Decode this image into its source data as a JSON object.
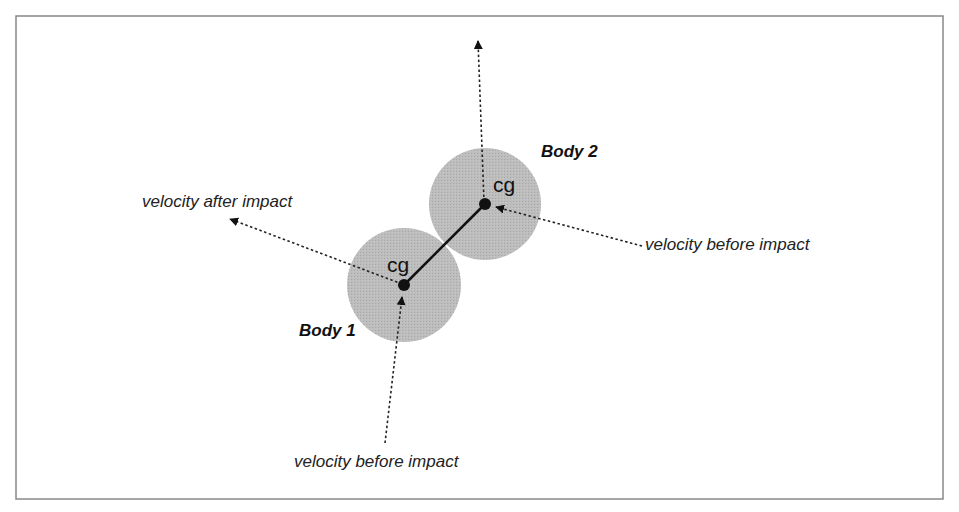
{
  "diagram": {
    "frame": {
      "x": 16,
      "y": 16,
      "width": 927,
      "height": 483,
      "stroke": "#888888"
    },
    "colors": {
      "body_fill": "#b5b5b5",
      "ink": "#111111",
      "text": "#222222"
    },
    "bodies": [
      {
        "name": "Body 1",
        "label": "Body 1",
        "cx": 404,
        "cy": 285,
        "r": 57,
        "cg_label": "cg",
        "label_x": 299,
        "label_y": 336
      },
      {
        "name": "Body 2",
        "label": "Body 2",
        "cx": 485,
        "cy": 204,
        "r": 56,
        "cg_label": "cg",
        "label_x": 541,
        "label_y": 157
      }
    ],
    "labels": {
      "velocity_after": "velocity after impact",
      "velocity_before_body2": "velocity before impact",
      "velocity_before_body1": "velocity before impact",
      "cg_body1": "cg",
      "cg_body2": "cg",
      "body1": "Body 1",
      "body2": "Body 2"
    }
  }
}
